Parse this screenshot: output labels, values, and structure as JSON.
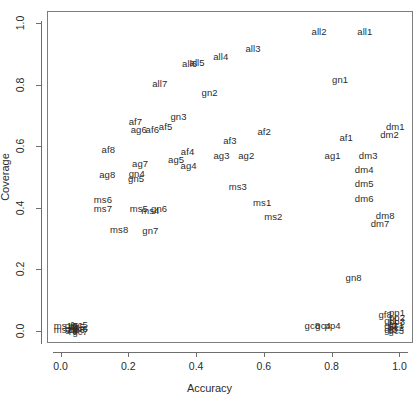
{
  "chart_data": {
    "type": "scatter",
    "title": "",
    "xlabel": "Accuracy",
    "ylabel": "Coverage",
    "xlim": [
      -0.04,
      1.04
    ],
    "ylim": [
      -0.04,
      1.04
    ],
    "xticks": [
      "0.0",
      "0.2",
      "0.4",
      "0.6",
      "0.8",
      "1.0"
    ],
    "xtick_values": [
      0.0,
      0.2,
      0.4,
      0.6,
      0.8,
      1.0
    ],
    "yticks": [
      "0.0",
      "0.2",
      "0.4",
      "0.6",
      "0.8",
      "1.0"
    ],
    "ytick_values": [
      0.0,
      0.2,
      0.4,
      0.6,
      0.8,
      1.0
    ],
    "grid": false,
    "legend": "none",
    "marker": "text-label",
    "points": [
      {
        "label": "all1",
        "x": 0.895,
        "y": 0.975
      },
      {
        "label": "all2",
        "x": 0.76,
        "y": 0.975
      },
      {
        "label": "all3",
        "x": 0.565,
        "y": 0.92
      },
      {
        "label": "all4",
        "x": 0.47,
        "y": 0.895
      },
      {
        "label": "all5",
        "x": 0.4,
        "y": 0.875
      },
      {
        "label": "all6",
        "x": 0.378,
        "y": 0.872
      },
      {
        "label": "all7",
        "x": 0.29,
        "y": 0.805
      },
      {
        "label": "gn1",
        "x": 0.822,
        "y": 0.82
      },
      {
        "label": "gn2",
        "x": 0.437,
        "y": 0.775
      },
      {
        "label": "gn3",
        "x": 0.345,
        "y": 0.7
      },
      {
        "label": "af7",
        "x": 0.218,
        "y": 0.682
      },
      {
        "label": "ag6",
        "x": 0.228,
        "y": 0.655
      },
      {
        "label": "af6",
        "x": 0.268,
        "y": 0.655
      },
      {
        "label": "af5",
        "x": 0.307,
        "y": 0.665
      },
      {
        "label": "af8",
        "x": 0.138,
        "y": 0.592
      },
      {
        "label": "ag8",
        "x": 0.135,
        "y": 0.51
      },
      {
        "label": "ag7",
        "x": 0.232,
        "y": 0.545
      },
      {
        "label": "gn4",
        "x": 0.222,
        "y": 0.512
      },
      {
        "label": "gn5",
        "x": 0.22,
        "y": 0.497
      },
      {
        "label": "ag5",
        "x": 0.338,
        "y": 0.557
      },
      {
        "label": "af4",
        "x": 0.372,
        "y": 0.585
      },
      {
        "label": "ag4",
        "x": 0.375,
        "y": 0.54
      },
      {
        "label": "af3",
        "x": 0.497,
        "y": 0.62
      },
      {
        "label": "af2",
        "x": 0.598,
        "y": 0.65
      },
      {
        "label": "ag3",
        "x": 0.472,
        "y": 0.57
      },
      {
        "label": "ag2",
        "x": 0.545,
        "y": 0.57
      },
      {
        "label": "af1",
        "x": 0.84,
        "y": 0.63
      },
      {
        "label": "ag1",
        "x": 0.8,
        "y": 0.57
      },
      {
        "label": "dm1",
        "x": 0.985,
        "y": 0.665
      },
      {
        "label": "dm2",
        "x": 0.968,
        "y": 0.64
      },
      {
        "label": "dm3",
        "x": 0.905,
        "y": 0.57
      },
      {
        "label": "dm4",
        "x": 0.893,
        "y": 0.525
      },
      {
        "label": "dm5",
        "x": 0.893,
        "y": 0.48
      },
      {
        "label": "dm6",
        "x": 0.893,
        "y": 0.432
      },
      {
        "label": "dm8",
        "x": 0.955,
        "y": 0.375
      },
      {
        "label": "dm7",
        "x": 0.94,
        "y": 0.352
      },
      {
        "label": "ms3",
        "x": 0.52,
        "y": 0.47
      },
      {
        "label": "ms1",
        "x": 0.592,
        "y": 0.418
      },
      {
        "label": "ms2",
        "x": 0.625,
        "y": 0.372
      },
      {
        "label": "ms6",
        "x": 0.122,
        "y": 0.428
      },
      {
        "label": "ms7",
        "x": 0.122,
        "y": 0.4
      },
      {
        "label": "ms5",
        "x": 0.228,
        "y": 0.398
      },
      {
        "label": "ms4",
        "x": 0.262,
        "y": 0.392
      },
      {
        "label": "gn6",
        "x": 0.288,
        "y": 0.4
      },
      {
        "label": "ms8",
        "x": 0.17,
        "y": 0.33
      },
      {
        "label": "gn7",
        "x": 0.262,
        "y": 0.328
      },
      {
        "label": "gn8",
        "x": 0.862,
        "y": 0.175
      },
      {
        "label": "gc8",
        "x": 0.74,
        "y": 0.02
      },
      {
        "label": "gc4",
        "x": 0.772,
        "y": 0.02
      },
      {
        "label": "pp4",
        "x": 0.8,
        "y": 0.02
      },
      {
        "label": "gf8",
        "x": 0.955,
        "y": 0.055
      },
      {
        "label": "pp1",
        "x": 0.99,
        "y": 0.06
      },
      {
        "label": "pp2",
        "x": 0.99,
        "y": 0.046
      },
      {
        "label": "pp3",
        "x": 0.99,
        "y": 0.033
      },
      {
        "label": "gc1",
        "x": 0.988,
        "y": 0.022
      },
      {
        "label": "gc2",
        "x": 0.988,
        "y": 0.012
      },
      {
        "label": "gc3",
        "x": 0.988,
        "y": 0.002
      },
      {
        "label": "gf1",
        "x": 0.972,
        "y": 0.035
      },
      {
        "label": "gf2",
        "x": 0.972,
        "y": 0.02
      },
      {
        "label": "gf3",
        "x": 0.972,
        "y": 0.006
      },
      {
        "label": "ms1b",
        "x": 0.012,
        "y": 0.018
      },
      {
        "label": "ms2b",
        "x": 0.012,
        "y": 0.006
      },
      {
        "label": "gf5",
        "x": 0.03,
        "y": 0.02
      },
      {
        "label": "gf6",
        "x": 0.03,
        "y": 0.008
      },
      {
        "label": "gc5",
        "x": 0.055,
        "y": 0.022
      },
      {
        "label": "gc6",
        "x": 0.055,
        "y": 0.01
      },
      {
        "label": "gc7",
        "x": 0.055,
        "y": 0.0
      },
      {
        "label": "pp5",
        "x": 0.045,
        "y": 0.016
      },
      {
        "label": "pp6",
        "x": 0.045,
        "y": 0.004
      }
    ]
  }
}
